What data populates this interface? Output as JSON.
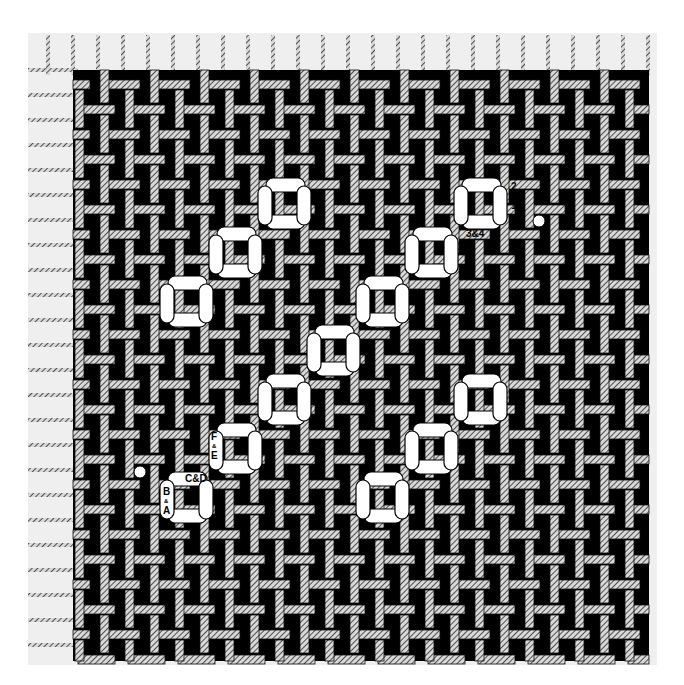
{
  "diagram": {
    "type": "needlepoint-stitch-chart",
    "grid": {
      "pitch_px": 25,
      "canvas_left": 73,
      "canvas_top": 70,
      "canvas_right": 649,
      "canvas_bottom": 661,
      "background_stitch": "woven-cross hatched bars on black",
      "margin_color": "#efefef",
      "ground_color": "#000000",
      "bar_color": "#bdbdbd"
    },
    "motif_squares": [
      {
        "x": 160,
        "y": 276
      },
      {
        "x": 209,
        "y": 227
      },
      {
        "x": 258,
        "y": 178
      },
      {
        "x": 307,
        "y": 325
      },
      {
        "x": 356,
        "y": 276
      },
      {
        "x": 405,
        "y": 227
      },
      {
        "x": 454,
        "y": 178
      },
      {
        "x": 258,
        "y": 374
      },
      {
        "x": 307,
        "y": 325
      },
      {
        "x": 209,
        "y": 423
      },
      {
        "x": 160,
        "y": 472
      },
      {
        "x": 356,
        "y": 472
      },
      {
        "x": 405,
        "y": 423
      },
      {
        "x": 454,
        "y": 374
      }
    ],
    "stitch_labels": [
      {
        "id": "label-2-1",
        "text_top": "2",
        "text_mid": "&",
        "text_bottom": "1",
        "arrow": "up",
        "x": 511,
        "y": 178
      },
      {
        "id": "label-3-4",
        "text": "3&4",
        "x": 466,
        "y": 229
      },
      {
        "id": "label-6-5",
        "text_top": "6",
        "text_mid": "&",
        "text_bottom": "5",
        "x": 470,
        "y": 240
      },
      {
        "id": "label-F-E",
        "text_top": "F",
        "text_mid": "&",
        "text_bottom": "E",
        "x": 211,
        "y": 428
      },
      {
        "id": "label-C-D",
        "text": "C&D",
        "x": 185,
        "y": 474
      },
      {
        "id": "label-B-A",
        "text_top": "B",
        "text_mid": "&",
        "text_bottom": "A",
        "arrow": "down",
        "x": 163,
        "y": 483
      }
    ],
    "start_dots": [
      {
        "x": 539,
        "y": 221
      },
      {
        "x": 140,
        "y": 472
      }
    ]
  }
}
